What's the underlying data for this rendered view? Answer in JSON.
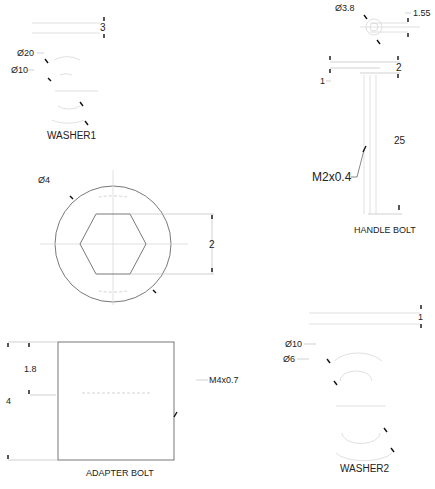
{
  "drawing": {
    "views": [
      {
        "id": "washer1",
        "title": "WASHER1",
        "dimensions": {
          "thickness": "3",
          "outer_diameter": "Ø20",
          "inner_diameter": "Ø10"
        }
      },
      {
        "id": "handle_bolt",
        "title": "HANDLE BOLT",
        "dimensions": {
          "head_diameter": "Ø3.8",
          "head_offset": "1.55",
          "head_height": "2",
          "step": "1",
          "length": "25",
          "thread": "M2x0.4"
        }
      },
      {
        "id": "hex_head",
        "title": "",
        "dimensions": {
          "outer_diameter": "Ø4",
          "hex_across_flats": "2"
        }
      },
      {
        "id": "adapter_bolt",
        "title": "ADAPTER BOLT",
        "dimensions": {
          "height": "4",
          "thread_depth": "1.8",
          "thread": "M4x0.7"
        }
      },
      {
        "id": "washer2",
        "title": "WASHER2",
        "dimensions": {
          "thickness": "1",
          "outer_diameter": "Ø10",
          "inner_diameter": "Ø6"
        }
      }
    ]
  }
}
